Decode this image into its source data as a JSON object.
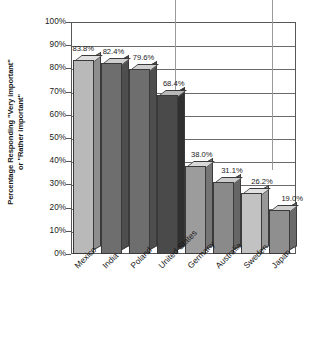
{
  "chart_data": {
    "type": "bar",
    "title": "",
    "xlabel": "",
    "ylabel": "Percentage Responding \"Very important\"\nor \"Rather important\"",
    "categories": [
      "Mexico",
      "India",
      "Poland",
      "United States",
      "Germany",
      "Australia",
      "Sweden",
      "Japan"
    ],
    "values": [
      83.8,
      82.4,
      79.6,
      68.4,
      38.0,
      31.1,
      26.2,
      19.0
    ],
    "value_labels": [
      "83.8%",
      "82.4%",
      "79.6%",
      "68.4%",
      "38.0%",
      "31.1%",
      "26.2%",
      "19.0%"
    ],
    "ylim": [
      0,
      100
    ],
    "ytick_labels": [
      "0%",
      "10%",
      "20%",
      "30%",
      "40%",
      "50%",
      "60%",
      "70%",
      "80%",
      "90%",
      "100%"
    ],
    "ytick_values": [
      0,
      10,
      20,
      30,
      40,
      50,
      60,
      70,
      80,
      90,
      100
    ],
    "grid": "horizontal",
    "legend": "none",
    "bar_style": "3d-extruded",
    "bar_colors": [
      "#b9b9b9",
      "#6e6e6e",
      "#6e6e6e",
      "#4a4a4a",
      "#9c9c9c",
      "#8a8a8a",
      "#c2c2c2",
      "#8f8f8f"
    ],
    "bar_top_colors": [
      "#e0e0e0",
      "#cfcfcf",
      "#cfcfcf",
      "#b8b8b8",
      "#d8d8d8",
      "#cccccc",
      "#e2e2e2",
      "#cfcfcf"
    ],
    "bar_side_colors": [
      "#8e8e8e",
      "#4e4e4e",
      "#4e4e4e",
      "#303030",
      "#757575",
      "#666666",
      "#989898",
      "#6a6a6a"
    ]
  },
  "axis": {
    "frame_color": "#585858",
    "grid_color": "#6b6b6b"
  }
}
